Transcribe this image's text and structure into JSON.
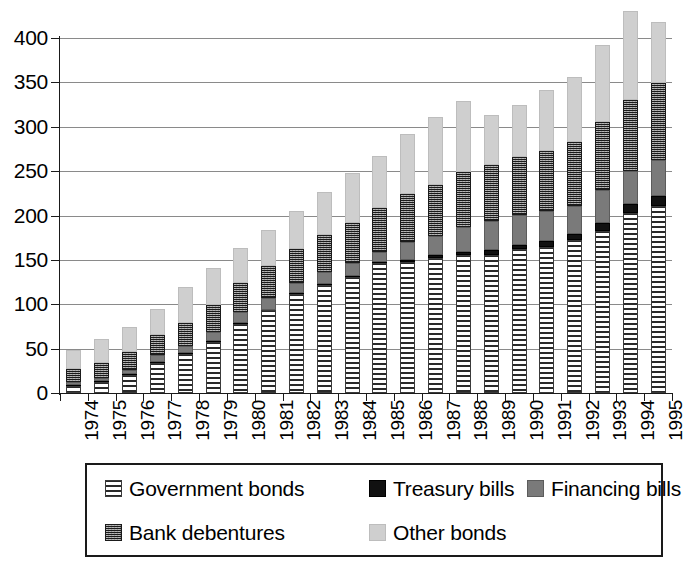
{
  "chart_data": {
    "type": "bar",
    "stacked": true,
    "title": "",
    "subtitle": "",
    "xlabel": "",
    "ylabel": "",
    "ylim": [
      0,
      400
    ],
    "ytick_step": 50,
    "yticks": [
      "400",
      "350",
      "300",
      "250",
      "200",
      "150",
      "100",
      "50",
      "0"
    ],
    "grid": true,
    "legend_position": "bottom",
    "categories": [
      "1974",
      "1975",
      "1976",
      "1977",
      "1978",
      "1979",
      "1980",
      "1981",
      "1982",
      "1983",
      "1984",
      "1985",
      "1986",
      "1987",
      "1988",
      "1989",
      "1990",
      "1991",
      "1992",
      "1993",
      "1994",
      "1995"
    ],
    "series": [
      {
        "name": "Government bonds",
        "color": "#2a2a2a",
        "pattern": "horizontal-lines",
        "values": [
          8,
          12,
          20,
          34,
          44,
          58,
          78,
          93,
          112,
          122,
          131,
          146,
          148,
          152,
          155,
          156,
          162,
          165,
          172,
          183,
          203,
          211
        ]
      },
      {
        "name": "Treasury bills",
        "color": "#111111",
        "pattern": "solid-black",
        "values": [
          1,
          1,
          1,
          1,
          1,
          1,
          1,
          1,
          1,
          1,
          1,
          2,
          2,
          3,
          4,
          5,
          5,
          6,
          7,
          9,
          10,
          11
        ]
      },
      {
        "name": "Financing bills",
        "color": "#7a7a7a",
        "pattern": "solid-gray",
        "values": [
          3,
          4,
          5,
          8,
          8,
          10,
          12,
          13,
          11,
          13,
          14,
          11,
          20,
          22,
          28,
          33,
          34,
          34,
          32,
          37,
          37,
          40
        ]
      },
      {
        "name": "Bank debentures",
        "color": "#3b3b3b",
        "pattern": "dense-grid",
        "values": [
          15,
          17,
          20,
          22,
          26,
          30,
          33,
          36,
          38,
          42,
          46,
          50,
          54,
          57,
          62,
          63,
          65,
          68,
          72,
          76,
          80,
          87
        ]
      },
      {
        "name": "Other bonds",
        "color": "#cfcfcf",
        "pattern": "light-gray",
        "values": [
          21,
          27,
          28,
          30,
          40,
          42,
          39,
          41,
          43,
          48,
          56,
          58,
          68,
          77,
          80,
          56,
          58,
          68,
          73,
          87,
          100,
          69
        ]
      }
    ],
    "totals": [
      48,
      61,
      74,
      95,
      119,
      141,
      163,
      184,
      205,
      226,
      248,
      267,
      292,
      311,
      329,
      313,
      324,
      341,
      356,
      392,
      430,
      418
    ]
  },
  "legend": {
    "items": [
      {
        "label": "Government bonds",
        "swatch": "horizontal-lines-swatch"
      },
      {
        "label": "Treasury bills",
        "swatch": "solid-black-swatch"
      },
      {
        "label": "Financing bills",
        "swatch": "solid-gray-swatch"
      },
      {
        "label": "Bank debentures",
        "swatch": "dense-grid-swatch"
      },
      {
        "label": "Other bonds",
        "swatch": "light-gray-swatch"
      }
    ]
  }
}
